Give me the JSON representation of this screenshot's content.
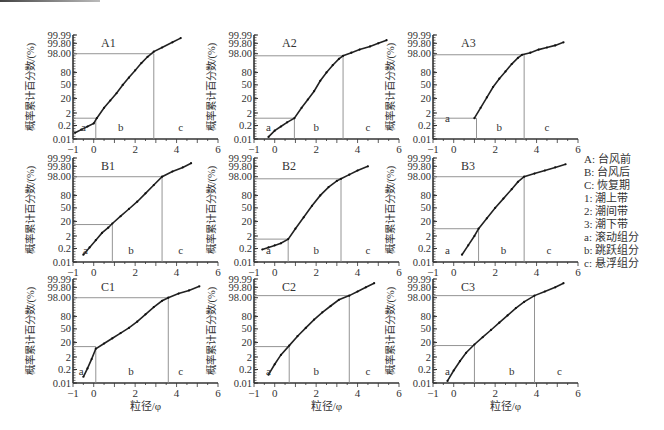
{
  "chart_data": {
    "type": "line",
    "title": "",
    "xlabel": "粒径/φ",
    "ylabel": "概率累计百分数/(%)",
    "xlim": [
      -1,
      6
    ],
    "xticks": [
      -1,
      0,
      2,
      4,
      6
    ],
    "yticks": [
      "0.01",
      "0.2",
      "2",
      "20",
      "50",
      "80",
      "98.00",
      "99.80",
      "99.99"
    ],
    "ytick_positions": [
      0,
      0.13,
      0.25,
      0.39,
      0.52,
      0.64,
      0.82,
      0.92,
      1.0
    ],
    "panels": [
      {
        "id": "A1",
        "row": 0,
        "col": 0,
        "ab_break": {
          "x": 0.1,
          "y_pos": 0.2
        },
        "bc_break": {
          "x": 2.9,
          "y_pos": 0.82
        },
        "labels": {
          "a": [
            -0.5,
            0.12
          ],
          "b": [
            1.3,
            0.12
          ],
          "c": [
            4.2,
            0.12
          ]
        },
        "points": [
          [
            -0.9,
            0.06
          ],
          [
            -0.6,
            0.09
          ],
          [
            -0.3,
            0.12
          ],
          [
            0.0,
            0.15
          ],
          [
            0.15,
            0.2
          ],
          [
            0.5,
            0.3
          ],
          [
            0.8,
            0.37
          ],
          [
            1.1,
            0.44
          ],
          [
            1.4,
            0.52
          ],
          [
            1.7,
            0.59
          ],
          [
            2.0,
            0.66
          ],
          [
            2.3,
            0.73
          ],
          [
            2.6,
            0.79
          ],
          [
            2.9,
            0.84
          ],
          [
            3.3,
            0.88
          ],
          [
            3.8,
            0.93
          ],
          [
            4.2,
            0.97
          ]
        ]
      },
      {
        "id": "A2",
        "row": 0,
        "col": 1,
        "ab_break": {
          "x": 0.95,
          "y_pos": 0.2
        },
        "bc_break": {
          "x": 3.3,
          "y_pos": 0.8
        },
        "labels": {
          "a": [
            -0.3,
            0.12
          ],
          "b": [
            2.0,
            0.12
          ],
          "c": [
            4.5,
            0.12
          ]
        },
        "points": [
          [
            -0.3,
            0.02
          ],
          [
            0.0,
            0.08
          ],
          [
            0.3,
            0.12
          ],
          [
            0.6,
            0.16
          ],
          [
            0.95,
            0.2
          ],
          [
            1.3,
            0.3
          ],
          [
            1.6,
            0.38
          ],
          [
            1.9,
            0.46
          ],
          [
            2.2,
            0.56
          ],
          [
            2.5,
            0.64
          ],
          [
            2.8,
            0.71
          ],
          [
            3.1,
            0.77
          ],
          [
            3.3,
            0.8
          ],
          [
            3.7,
            0.83
          ],
          [
            4.1,
            0.86
          ],
          [
            4.6,
            0.89
          ],
          [
            5.0,
            0.92
          ],
          [
            5.4,
            0.95
          ]
        ]
      },
      {
        "id": "A3",
        "row": 0,
        "col": 2,
        "ab_break": {
          "x": 1.1,
          "y_pos": 0.2
        },
        "bc_break": {
          "x": 3.4,
          "y_pos": 0.81
        },
        "labels": {
          "a": [
            -0.3,
            0.2
          ],
          "b": [
            2.2,
            0.12
          ],
          "c": [
            4.5,
            0.12
          ]
        },
        "points": [
          [
            1.0,
            0.2
          ],
          [
            1.3,
            0.3
          ],
          [
            1.6,
            0.4
          ],
          [
            1.9,
            0.5
          ],
          [
            2.2,
            0.58
          ],
          [
            2.5,
            0.65
          ],
          [
            2.8,
            0.72
          ],
          [
            3.1,
            0.78
          ],
          [
            3.3,
            0.81
          ],
          [
            3.7,
            0.83
          ],
          [
            4.1,
            0.86
          ],
          [
            4.5,
            0.88
          ],
          [
            4.9,
            0.9
          ],
          [
            5.3,
            0.93
          ]
        ]
      },
      {
        "id": "B1",
        "row": 1,
        "col": 0,
        "ab_break": {
          "x": 0.9,
          "y_pos": 0.36
        },
        "bc_break": {
          "x": 3.3,
          "y_pos": 0.82
        },
        "labels": {
          "a": [
            -0.4,
            0.12
          ],
          "b": [
            1.8,
            0.12
          ],
          "c": [
            4.2,
            0.12
          ]
        },
        "points": [
          [
            -0.5,
            0.07
          ],
          [
            -0.2,
            0.14
          ],
          [
            0.1,
            0.21
          ],
          [
            0.4,
            0.28
          ],
          [
            0.7,
            0.33
          ],
          [
            0.9,
            0.37
          ],
          [
            1.3,
            0.44
          ],
          [
            1.7,
            0.51
          ],
          [
            2.1,
            0.58
          ],
          [
            2.5,
            0.66
          ],
          [
            2.9,
            0.74
          ],
          [
            3.3,
            0.82
          ],
          [
            3.8,
            0.87
          ],
          [
            4.3,
            0.91
          ],
          [
            4.7,
            0.95
          ]
        ]
      },
      {
        "id": "B2",
        "row": 1,
        "col": 1,
        "ab_break": {
          "x": 0.65,
          "y_pos": 0.22
        },
        "bc_break": {
          "x": 3.2,
          "y_pos": 0.8
        },
        "labels": {
          "a": [
            -0.3,
            0.12
          ],
          "b": [
            2.0,
            0.12
          ],
          "c": [
            4.5,
            0.12
          ]
        },
        "points": [
          [
            -0.6,
            0.12
          ],
          [
            -0.3,
            0.14
          ],
          [
            0.0,
            0.16
          ],
          [
            0.3,
            0.18
          ],
          [
            0.65,
            0.22
          ],
          [
            1.0,
            0.32
          ],
          [
            1.4,
            0.43
          ],
          [
            1.8,
            0.54
          ],
          [
            2.2,
            0.64
          ],
          [
            2.6,
            0.72
          ],
          [
            3.0,
            0.78
          ],
          [
            3.2,
            0.8
          ],
          [
            3.6,
            0.84
          ],
          [
            4.0,
            0.88
          ],
          [
            4.5,
            0.92
          ]
        ]
      },
      {
        "id": "B3",
        "row": 1,
        "col": 2,
        "ab_break": {
          "x": 1.2,
          "y_pos": 0.32
        },
        "bc_break": {
          "x": 3.4,
          "y_pos": 0.82
        },
        "labels": {
          "a": [
            -0.3,
            0.12
          ],
          "b": [
            2.4,
            0.12
          ],
          "c": [
            4.6,
            0.12
          ]
        },
        "points": [
          [
            0.4,
            0.07
          ],
          [
            0.7,
            0.16
          ],
          [
            1.0,
            0.25
          ],
          [
            1.2,
            0.32
          ],
          [
            1.6,
            0.42
          ],
          [
            2.0,
            0.52
          ],
          [
            2.4,
            0.61
          ],
          [
            2.8,
            0.7
          ],
          [
            3.1,
            0.77
          ],
          [
            3.4,
            0.82
          ],
          [
            3.9,
            0.85
          ],
          [
            4.4,
            0.88
          ],
          [
            4.9,
            0.91
          ],
          [
            5.4,
            0.94
          ]
        ]
      },
      {
        "id": "C1",
        "row": 2,
        "col": 0,
        "ab_break": {
          "x": 0.1,
          "y_pos": 0.35
        },
        "bc_break": {
          "x": 3.6,
          "y_pos": 0.82
        },
        "labels": {
          "a": [
            -0.6,
            0.12
          ],
          "b": [
            1.8,
            0.12
          ],
          "c": [
            4.2,
            0.12
          ]
        },
        "points": [
          [
            -0.5,
            0.06
          ],
          [
            -0.3,
            0.14
          ],
          [
            -0.1,
            0.23
          ],
          [
            0.1,
            0.33
          ],
          [
            0.5,
            0.38
          ],
          [
            0.9,
            0.43
          ],
          [
            1.3,
            0.48
          ],
          [
            1.7,
            0.53
          ],
          [
            2.1,
            0.59
          ],
          [
            2.5,
            0.66
          ],
          [
            2.9,
            0.73
          ],
          [
            3.3,
            0.79
          ],
          [
            3.6,
            0.82
          ],
          [
            4.1,
            0.86
          ],
          [
            4.6,
            0.89
          ],
          [
            5.1,
            0.93
          ]
        ]
      },
      {
        "id": "C2",
        "row": 2,
        "col": 1,
        "ab_break": {
          "x": 0.7,
          "y_pos": 0.35
        },
        "bc_break": {
          "x": 3.6,
          "y_pos": 0.84
        },
        "labels": {
          "a": [
            -0.3,
            0.12
          ],
          "b": [
            2.0,
            0.12
          ],
          "c": [
            4.5,
            0.12
          ]
        },
        "points": [
          [
            -0.3,
            0.08
          ],
          [
            0.0,
            0.18
          ],
          [
            0.3,
            0.27
          ],
          [
            0.7,
            0.36
          ],
          [
            1.1,
            0.45
          ],
          [
            1.5,
            0.53
          ],
          [
            1.9,
            0.61
          ],
          [
            2.3,
            0.68
          ],
          [
            2.7,
            0.74
          ],
          [
            3.1,
            0.8
          ],
          [
            3.6,
            0.84
          ],
          [
            4.0,
            0.88
          ],
          [
            4.4,
            0.92
          ],
          [
            4.8,
            0.96
          ]
        ]
      },
      {
        "id": "C3",
        "row": 2,
        "col": 2,
        "ab_break": {
          "x": 1.0,
          "y_pos": 0.36
        },
        "bc_break": {
          "x": 3.9,
          "y_pos": 0.84
        },
        "labels": {
          "a": [
            -0.3,
            0.12
          ],
          "b": [
            2.8,
            0.12
          ],
          "c": [
            5.1,
            0.12
          ]
        },
        "points": [
          [
            -0.3,
            0.02
          ],
          [
            0.0,
            0.12
          ],
          [
            0.3,
            0.21
          ],
          [
            0.6,
            0.29
          ],
          [
            1.0,
            0.37
          ],
          [
            1.4,
            0.44
          ],
          [
            1.8,
            0.51
          ],
          [
            2.2,
            0.58
          ],
          [
            2.6,
            0.65
          ],
          [
            3.0,
            0.72
          ],
          [
            3.4,
            0.78
          ],
          [
            3.9,
            0.84
          ],
          [
            4.4,
            0.88
          ],
          [
            4.9,
            0.92
          ],
          [
            5.3,
            0.96
          ]
        ]
      }
    ],
    "legend_position": "right"
  },
  "legend": [
    "A: 台风前",
    "B: 台风后",
    "C: 恢复期",
    "1: 潮上带",
    "2: 潮间带",
    "3: 潮下带",
    "a: 滚动组分",
    "b: 跳跃组分",
    "c: 悬浮组分"
  ],
  "layout": {
    "col_axis_x": [
      73,
      254,
      433
    ],
    "row_top_y": [
      35,
      158,
      279
    ],
    "plot_width": 145,
    "plot_height": 104
  }
}
